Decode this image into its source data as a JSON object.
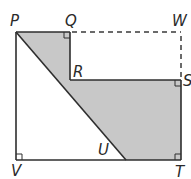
{
  "diagram": {
    "labels": {
      "P": "P",
      "Q": "Q",
      "W": "W",
      "R": "R",
      "S": "S",
      "U": "U",
      "V": "V",
      "T": "T"
    },
    "shaded_region": "P-Q-R-S-T-U",
    "dashed_segments": [
      "QW",
      "WS"
    ],
    "right_angles": [
      "Q",
      "S",
      "V",
      "T"
    ],
    "colors": {
      "shade": "#c8c8c8",
      "line": "#2e2e2e"
    }
  }
}
